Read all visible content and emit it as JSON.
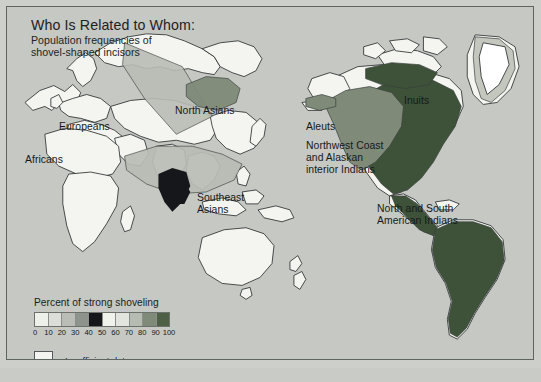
{
  "figure": {
    "title": "Who Is Related to Whom:",
    "subtitle_line1": "Population frequencies of",
    "subtitle_line2": "shovel-shaped incisors"
  },
  "map": {
    "region_labels": [
      {
        "id": "europeans",
        "text": "Europeans"
      },
      {
        "id": "africans",
        "text": "Africans"
      },
      {
        "id": "north-asians",
        "text": "North Asians"
      },
      {
        "id": "southeast-asians-1",
        "text": "Southeast"
      },
      {
        "id": "southeast-asians-2",
        "text": "Asians"
      },
      {
        "id": "inuits",
        "text": "Inuits"
      },
      {
        "id": "aleuts",
        "text": "Aleuts"
      },
      {
        "id": "northwest-1",
        "text": "Northwest Coast"
      },
      {
        "id": "northwest-2",
        "text": "and Alaskan"
      },
      {
        "id": "northwest-3",
        "text": "interior Indians"
      },
      {
        "id": "americas-1",
        "text": "North and South"
      },
      {
        "id": "americas-2",
        "text": "American Indians"
      }
    ]
  },
  "legend": {
    "title": "Percent of strong shoveling",
    "ticks": [
      "0",
      "10",
      "20",
      "30",
      "40",
      "50",
      "60",
      "70",
      "80",
      "90",
      "100"
    ],
    "swatch_colors": [
      "#eef0ea",
      "#dcdfd8",
      "#b9bdb5",
      "#8e938b",
      "#15171a",
      "#f0f2ec",
      "#e2e5de",
      "#b6bcb2",
      "#7f8a79",
      "#4d6046"
    ],
    "insufficient_label": "Insufficient data",
    "insufficient_color": "#f4f5f1"
  },
  "chart_data": {
    "type": "map",
    "title": "Who Is Related to Whom: Population frequencies of shovel-shaped incisors",
    "variable": "Percent of strong shoveling",
    "scale_min": 0,
    "scale_max": 100,
    "units": "percent",
    "legend_position": "bottom-left",
    "categories": [
      "Europeans",
      "Africans",
      "North Asians",
      "Southeast Asians",
      "Inuits",
      "Aleuts",
      "Northwest Coast and Alaskan interior Indians",
      "North and South American Indians"
    ],
    "regions": [
      {
        "name": "Africans",
        "class": "low",
        "value_range": [
          0,
          10
        ],
        "fill": "#f2f3ee"
      },
      {
        "name": "Europeans",
        "class": "low",
        "value_range": [
          0,
          10
        ],
        "fill": "#f2f3ee"
      },
      {
        "name": "Central Asia band",
        "class": "moderate",
        "value_range": [
          30,
          50
        ],
        "fill": "#b9bdb5"
      },
      {
        "name": "North Asians",
        "class": "high",
        "value_range": [
          70,
          90
        ],
        "fill": "#7f8a79"
      },
      {
        "name": "Southeast Asians",
        "class": "moderate",
        "value_range": [
          30,
          50
        ],
        "fill": "#b9bdb5"
      },
      {
        "name": "South China / Indochina",
        "class": "very-high",
        "value_range": [
          90,
          100
        ],
        "fill": "#15171a"
      },
      {
        "name": "Inuits",
        "class": "very-high",
        "value_range": [
          80,
          100
        ],
        "fill": "#3d5238"
      },
      {
        "name": "Aleuts",
        "class": "high",
        "value_range": [
          60,
          80
        ],
        "fill": "#7f8a79"
      },
      {
        "name": "Northwest Coast and Alaskan interior Indians",
        "class": "high",
        "value_range": [
          60,
          80
        ],
        "fill": "#7f8a79"
      },
      {
        "name": "North and South American Indians",
        "class": "very-high",
        "value_range": [
          85,
          100
        ],
        "fill": "#3d5238"
      },
      {
        "name": "Greenland",
        "class": "moderate",
        "value_range": [
          40,
          60
        ],
        "fill": "#c3c7be"
      },
      {
        "name": "Australia",
        "class": "insufficient",
        "value_range": null,
        "fill": "#f4f5f1"
      },
      {
        "name": "New Zealand",
        "class": "insufficient",
        "value_range": null,
        "fill": "#f4f5f1"
      }
    ]
  }
}
